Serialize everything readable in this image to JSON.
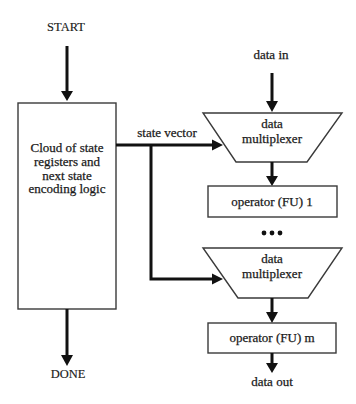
{
  "diagram": {
    "type": "flowchart",
    "start_label": "START",
    "done_label": "DONE",
    "controller": {
      "lines": [
        "Cloud of state",
        "registers and",
        "next state",
        "encoding logic"
      ]
    },
    "state_vector_label": "state vector",
    "data_in_label": "data in",
    "data_out_label": "data out",
    "mux_1": {
      "line1": "data",
      "line2": "multiplexer"
    },
    "operator_1": {
      "label": "operator (FU) 1"
    },
    "ellipsis": "•••",
    "mux_m": {
      "line1": "data",
      "line2": "multiplexer"
    },
    "operator_m": {
      "label": "operator (FU) m"
    },
    "icons": {
      "arrow": "arrow-down-icon",
      "arrow_right": "arrow-right-icon",
      "ellipsis": "ellipsis-icon"
    },
    "colors": {
      "line": "#111111",
      "box_border": "#3a3a3a",
      "background": "#ffffff"
    }
  }
}
